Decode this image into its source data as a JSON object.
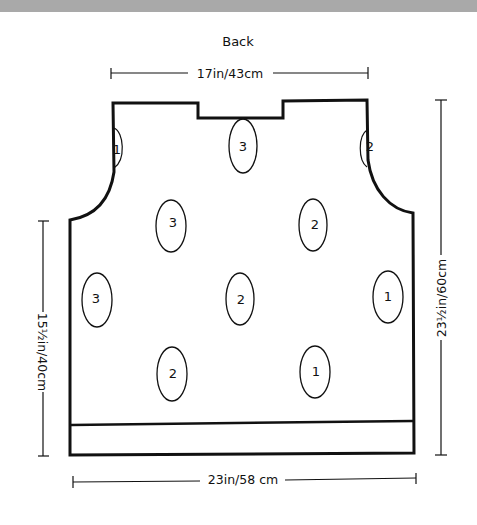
{
  "colors": {
    "band": "#a9a9a9",
    "ink": "#111111",
    "paper": "#ffffff"
  },
  "title": "Back",
  "dimensions": {
    "top": "17in/43cm",
    "bottom": "23in/58 cm",
    "left": "15½in/40cm",
    "right": "23½in/60cm"
  },
  "motifs": [
    {
      "label": "1",
      "note": "armhole left, partial"
    },
    {
      "label": "2",
      "note": "armhole right, partial"
    },
    {
      "label": "3"
    },
    {
      "label": "3"
    },
    {
      "label": "2"
    },
    {
      "label": "3"
    },
    {
      "label": "2"
    },
    {
      "label": "1"
    },
    {
      "label": "2"
    },
    {
      "label": "1"
    }
  ]
}
